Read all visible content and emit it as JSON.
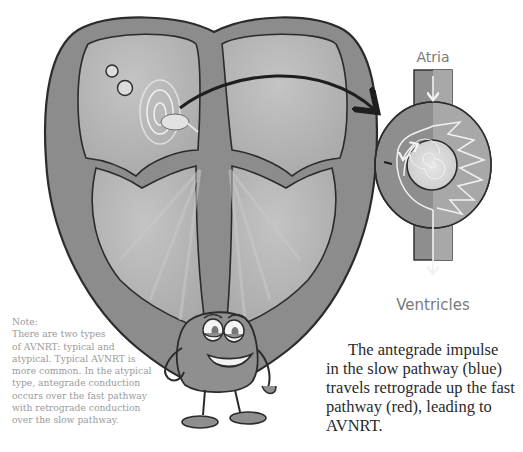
{
  "diagram": {
    "main_illustration": "Cartoon heart (cross-section) with AV node highlighted by concentric circles",
    "inset": {
      "top_label": "Atria",
      "bottom_label": "Ventricles",
      "description": "AV node with slow pathway (left, looping arrow) and fast pathway (right, zigzag)"
    },
    "connector": "curved arrow from AV node to inset"
  },
  "note": {
    "heading": "Note:",
    "lines": [
      "There are two types",
      "of AVNRT: typical and",
      "atypical. Typical AVNRT is",
      "more common. In the atypical",
      "type, antegrade conduction",
      "occurs over the fast pathway",
      "with retrograde conduction",
      "over the slow pathway."
    ]
  },
  "caption": {
    "lines": [
      "The antegrade impulse",
      "in the slow pathway (blue)",
      "travels retrograde up the fast",
      "pathway (red), leading to",
      "AVNRT."
    ]
  },
  "colors": {
    "outline": "#2b2b2b",
    "wall": "#8c8c8c",
    "chamber": "#b4b4b4",
    "node_core": "#d8d8d8",
    "label_gray": "#7a7a7a"
  }
}
